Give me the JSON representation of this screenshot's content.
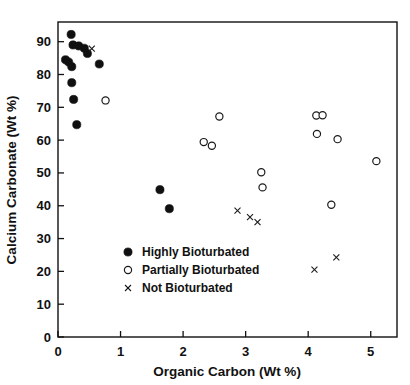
{
  "chart_data": {
    "type": "scatter",
    "title": "",
    "xlabel": "Organic Carbon (Wt %)",
    "ylabel": "Calcium Carbonate (Wt %)",
    "xlim": [
      0,
      5.42
    ],
    "ylim": [
      0,
      96
    ],
    "xticks": [
      0,
      1,
      2,
      3,
      4,
      5
    ],
    "xtick_labels": [
      "0",
      "1",
      "2",
      "3",
      "4",
      "5"
    ],
    "yticks": [
      0,
      10,
      20,
      30,
      40,
      50,
      60,
      70,
      80,
      90
    ],
    "ytick_labels": [
      "0",
      "10",
      "20",
      "30",
      "40",
      "50",
      "60",
      "70",
      "80",
      "90"
    ],
    "grid": false,
    "legend_position": "lower-left-inside",
    "series": [
      {
        "name": "Highly Bioturbated",
        "marker": "filled-circle",
        "color": "#101010",
        "points": [
          {
            "x": 0.12,
            "y": 84.5
          },
          {
            "x": 0.17,
            "y": 83.8
          },
          {
            "x": 0.21,
            "y": 92.2
          },
          {
            "x": 0.22,
            "y": 82.4
          },
          {
            "x": 0.24,
            "y": 89.0
          },
          {
            "x": 0.22,
            "y": 77.5
          },
          {
            "x": 0.25,
            "y": 72.4
          },
          {
            "x": 0.33,
            "y": 88.7
          },
          {
            "x": 0.3,
            "y": 64.7
          },
          {
            "x": 0.42,
            "y": 88.0
          },
          {
            "x": 0.47,
            "y": 86.4
          },
          {
            "x": 0.66,
            "y": 83.2
          },
          {
            "x": 1.63,
            "y": 44.9
          },
          {
            "x": 1.78,
            "y": 39.1
          }
        ]
      },
      {
        "name": "Partially Bioturbated",
        "marker": "open-circle",
        "color": "#1a1a1a",
        "points": [
          {
            "x": 0.76,
            "y": 72.1
          },
          {
            "x": 2.33,
            "y": 59.4
          },
          {
            "x": 2.46,
            "y": 58.3
          },
          {
            "x": 2.58,
            "y": 67.2
          },
          {
            "x": 3.25,
            "y": 50.2
          },
          {
            "x": 3.27,
            "y": 45.6
          },
          {
            "x": 4.13,
            "y": 67.5
          },
          {
            "x": 4.23,
            "y": 67.6
          },
          {
            "x": 4.14,
            "y": 61.9
          },
          {
            "x": 4.47,
            "y": 60.3
          },
          {
            "x": 4.37,
            "y": 40.3
          },
          {
            "x": 5.09,
            "y": 53.6
          }
        ]
      },
      {
        "name": "Not Bioturbated",
        "marker": "cross",
        "color": "#1a1a1a",
        "points": [
          {
            "x": 0.54,
            "y": 87.9
          },
          {
            "x": 2.87,
            "y": 38.5
          },
          {
            "x": 3.07,
            "y": 36.5
          },
          {
            "x": 3.19,
            "y": 35.0
          },
          {
            "x": 4.1,
            "y": 20.5
          },
          {
            "x": 4.45,
            "y": 24.3
          }
        ]
      }
    ],
    "legend_entries": [
      {
        "label": "Highly Bioturbated",
        "marker": "filled-circle"
      },
      {
        "label": "Partially Bioturbated",
        "marker": "open-circle"
      },
      {
        "label": "Not Bioturbated",
        "marker": "cross"
      }
    ]
  }
}
